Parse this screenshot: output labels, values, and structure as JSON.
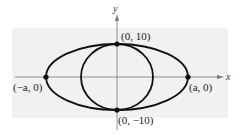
{
  "diagram": {
    "axes": {
      "x_label": "x",
      "y_label": "y"
    },
    "curves": [
      {
        "name": "ellipse",
        "center": [
          0,
          0
        ],
        "semi_major": "a",
        "semi_minor": 10
      },
      {
        "name": "circle",
        "center": [
          0,
          0
        ],
        "radius": 10
      }
    ],
    "points": {
      "top": "(0, 10)",
      "bottom": "(0, −10)",
      "left": "(−a, 0)",
      "right": "(a, 0)"
    },
    "colors": {
      "background_panel": "#f0f0f0",
      "stroke": "#111111"
    }
  }
}
